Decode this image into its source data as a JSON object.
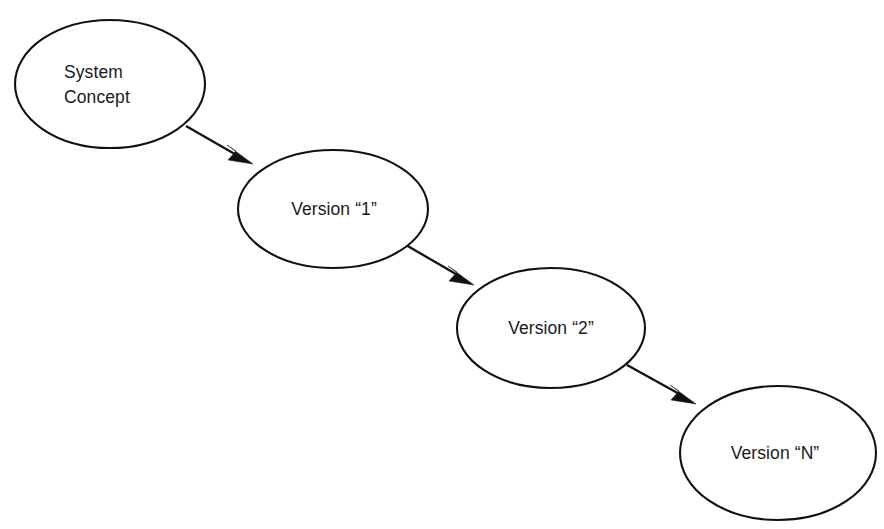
{
  "diagram": {
    "background_color": "#ffffff",
    "stroke_color": "#111111",
    "text_color": "#1a1a1a",
    "nodes": [
      {
        "id": "system-concept",
        "label_line1": "System",
        "label_line2": "Concept",
        "shape": "ellipse",
        "cx": 110,
        "cy": 84,
        "rx": 95,
        "ry": 64
      },
      {
        "id": "version-1",
        "label": "Version “1”",
        "shape": "ellipse",
        "cx": 333,
        "cy": 209,
        "rx": 95,
        "ry": 59
      },
      {
        "id": "version-2",
        "label": "Version “2”",
        "shape": "ellipse",
        "cx": 551,
        "cy": 328,
        "rx": 94,
        "ry": 60
      },
      {
        "id": "version-n",
        "label": "Version “N”",
        "shape": "ellipse",
        "cx": 778,
        "cy": 453,
        "rx": 98,
        "ry": 67
      }
    ],
    "edges": [
      {
        "id": "edge-concept-to-v1",
        "from": "system-concept",
        "to": "version-1",
        "style": "solid-arrow",
        "x1": 186,
        "y1": 126,
        "x2": 253,
        "y2": 164
      },
      {
        "id": "edge-v1-to-v2",
        "from": "version-1",
        "to": "version-2",
        "style": "solid-arrow",
        "x1": 406,
        "y1": 245,
        "x2": 474,
        "y2": 285
      },
      {
        "id": "edge-v2-to-vn",
        "from": "version-2",
        "to": "version-n",
        "style": "solid-arrow",
        "x1": 627,
        "y1": 365,
        "x2": 696,
        "y2": 404
      }
    ]
  }
}
